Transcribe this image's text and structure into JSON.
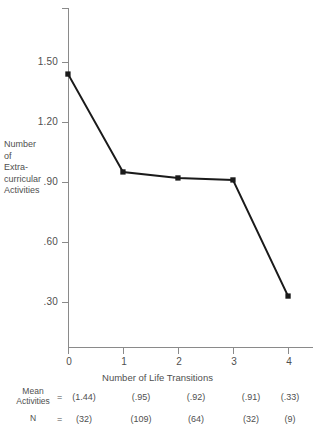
{
  "chart_data": {
    "type": "line",
    "title": "",
    "xlabel": "Number of  Life  Transitions",
    "ylabel_lines": [
      "Number",
      "of",
      "Extra-",
      "curricular",
      "Activities"
    ],
    "x": [
      0,
      1,
      2,
      3,
      4
    ],
    "categories": [
      "0",
      "1",
      "2",
      "3",
      "4"
    ],
    "values": [
      1.44,
      0.95,
      0.92,
      0.91,
      0.33
    ],
    "series": [
      {
        "name": "Mean Activities",
        "values": [
          1.44,
          0.95,
          0.92,
          0.91,
          0.33
        ]
      }
    ],
    "n_values": [
      32,
      109,
      64,
      32,
      9
    ],
    "xlim": [
      0,
      4.45
    ],
    "ylim": [
      0,
      1.75
    ],
    "yticks": [
      0.3,
      0.6,
      0.9,
      1.2,
      1.5
    ],
    "ytick_labels": [
      ".30",
      ".60",
      ".90",
      "1.20",
      "1.50"
    ],
    "xticks": [
      0,
      1,
      2,
      3,
      4
    ],
    "xtick_labels": [
      "0",
      "1",
      "2",
      "3",
      "4"
    ],
    "grid": false,
    "legend": "none",
    "line_color": "#1a1a1a",
    "marker": "square",
    "axis_color": "#8a8a8a",
    "text_color": "#4f4f4f"
  },
  "axes": {
    "y_title_lines": [
      "Number",
      "of",
      "Extra-",
      "curricular",
      "Activities"
    ],
    "x_title": "Number of  Life  Transitions",
    "ytick_labels": [
      "1.50",
      "1.20",
      ".90",
      ".60",
      ".30"
    ],
    "xtick_labels": [
      "0",
      "1",
      "2",
      "3",
      "4"
    ]
  },
  "footer": {
    "mean_row": {
      "label_lines": [
        "Mean",
        "Activities"
      ],
      "equals": "=",
      "values": [
        "(1.44)",
        "(.95)",
        "(.92)",
        "(.91)",
        "(.33)"
      ]
    },
    "n_row": {
      "label_lines": [
        "N"
      ],
      "equals": "=",
      "values": [
        "(32)",
        "(109)",
        "(64)",
        "(32)",
        "(9)"
      ]
    }
  }
}
